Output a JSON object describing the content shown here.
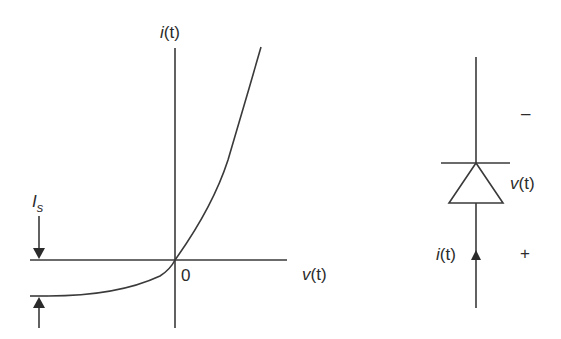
{
  "graph": {
    "y_axis_label_var": "i",
    "y_axis_label_arg": "(t)",
    "x_axis_label_var": "v",
    "x_axis_label_arg": "(t)",
    "origin_label": "0",
    "saturation_label_main": "I",
    "saturation_label_sub": "s"
  },
  "circuit": {
    "voltage_label_var": "v",
    "voltage_label_arg": "(t)",
    "current_label_var": "i",
    "current_label_arg": "(t)",
    "minus_sign": "–",
    "plus_sign": "+"
  },
  "colors": {
    "stroke": "#3a3a3a",
    "text": "#2b2b2b",
    "background": "#ffffff"
  }
}
